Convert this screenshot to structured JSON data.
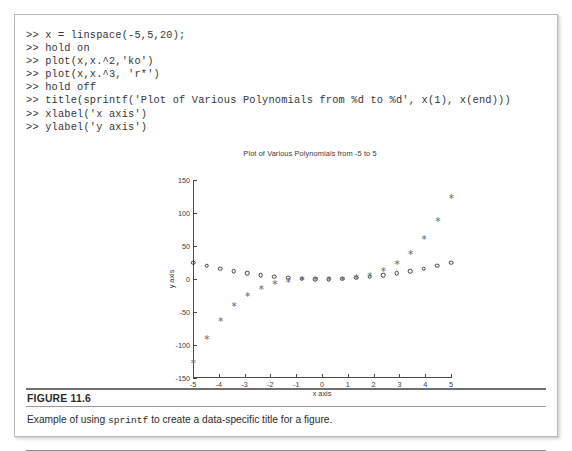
{
  "figure": {
    "number_label": "FIGURE 11.6",
    "caption_before": "Example of using ",
    "caption_mono": "sprintf",
    "caption_after": " to create a data-specific title for a figure."
  },
  "code": {
    "lines": [
      ">> x = linspace(-5,5,20);",
      ">> hold on",
      ">> plot(x,x.^2,'ko')",
      ">> plot(x,x.^3, 'r*')",
      ">> hold off",
      ">> title(sprintf('Plot of Various Polynomials from %d to %d', x(1), x(end)))",
      ">> xlabel('x axis')",
      ">> ylabel('y axis')"
    ]
  },
  "chart_data": {
    "type": "scatter",
    "title": "Plot of Various Polynomials from -5 to 5",
    "xlabel": "x axis",
    "ylabel": "y axis",
    "xlim": [
      -5,
      5
    ],
    "ylim": [
      -150,
      150
    ],
    "xticks": [
      -5,
      -4,
      -3,
      -2,
      -1,
      0,
      1,
      2,
      3,
      4,
      5
    ],
    "xticklabels": [
      "-5",
      "-4",
      "-3",
      "-2",
      "-1",
      "0",
      "1",
      "2",
      "3",
      "4",
      "5"
    ],
    "yticks": [
      -150,
      -100,
      -50,
      0,
      50,
      100,
      150
    ],
    "yticklabels": [
      "-150",
      "-100",
      "-50",
      "0",
      "50",
      "100",
      "150"
    ],
    "grid": false,
    "legend": null,
    "x": [
      -5,
      -4.4737,
      -3.9474,
      -3.4211,
      -2.8947,
      -2.3684,
      -1.8421,
      -1.3158,
      -0.7895,
      -0.2632,
      0.2632,
      0.7895,
      1.3158,
      1.8421,
      2.3684,
      2.8947,
      3.4211,
      3.9474,
      4.4737,
      5
    ],
    "series": [
      {
        "name": "x.^2",
        "marker": "ko",
        "marker_shape": "open-circle",
        "color": "#3d3d42",
        "values": [
          25,
          20.01,
          15.58,
          11.7,
          8.38,
          5.61,
          3.39,
          1.73,
          0.62,
          0.07,
          0.07,
          0.62,
          1.73,
          3.39,
          5.61,
          8.38,
          11.7,
          15.58,
          20.01,
          25
        ]
      },
      {
        "name": "x.^3",
        "marker": "r*",
        "marker_shape": "asterisk",
        "color": "#6e6e74",
        "values": [
          -125,
          -89.53,
          -61.5,
          -40.03,
          -24.27,
          -13.28,
          -6.25,
          -2.28,
          -0.49,
          -0.018,
          0.018,
          0.49,
          2.28,
          6.25,
          13.28,
          24.27,
          40.03,
          61.5,
          89.53,
          125
        ]
      }
    ]
  }
}
